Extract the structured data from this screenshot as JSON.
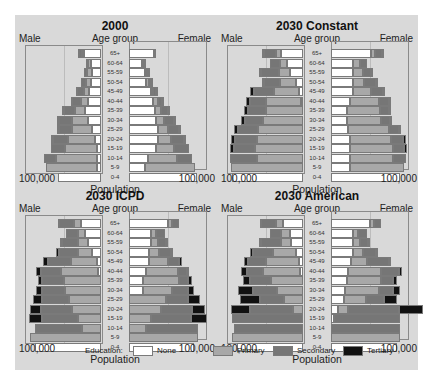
{
  "chart_data": [
    {
      "type": "bar",
      "subtype": "population-pyramid-stacked",
      "title": "2000",
      "xlabel": "Population",
      "ylabel": "Age group",
      "left_label": "Male",
      "right_label": "Female",
      "x_ticks": [
        "100,000",
        "100,000"
      ],
      "xlim": [
        0,
        100000
      ],
      "categories": [
        "65+",
        "60-64",
        "55-59",
        "50-54",
        "45-49",
        "40-44",
        "35-39",
        "30-34",
        "25-29",
        "20-24",
        "15-19",
        "10-14",
        "5-9",
        "0-4"
      ],
      "male": {
        "None": [
          24000,
          14000,
          13000,
          14000,
          16000,
          18000,
          22000,
          18000,
          12000,
          8000,
          6000,
          5000,
          6000,
          60000
        ],
        "Primary": [
          3000,
          4000,
          6000,
          7000,
          8000,
          10000,
          14000,
          22000,
          28000,
          38000,
          44000,
          58000,
          70000,
          0
        ],
        "Secondary": [
          4000,
          3000,
          5000,
          7000,
          9000,
          12000,
          16000,
          18000,
          18000,
          20000,
          20000,
          16000,
          0,
          0
        ],
        "Tertiary": [
          1000,
          0,
          0,
          0,
          2000,
          2000,
          2000,
          3000,
          3000,
          4000,
          0,
          0,
          0,
          0
        ]
      },
      "female": {
        "None": [
          35000,
          18000,
          22000,
          24000,
          30000,
          34000,
          36000,
          38000,
          40000,
          40000,
          38000,
          27000,
          22000,
          95000
        ],
        "Primary": [
          0,
          2000,
          2000,
          4000,
          4000,
          6000,
          8000,
          10000,
          14000,
          18000,
          24000,
          40000,
          70000,
          0
        ],
        "Secondary": [
          0,
          1000,
          2000,
          2000,
          4000,
          6000,
          10000,
          14000,
          16000,
          18000,
          22000,
          20000,
          0,
          0
        ],
        "Tertiary": [
          1000,
          1000,
          1000,
          1000,
          2000,
          2000,
          2000,
          2000,
          2000,
          2000,
          0,
          0,
          0,
          0
        ]
      }
    },
    {
      "type": "bar",
      "subtype": "population-pyramid-stacked",
      "title": "2030 Constant",
      "xlabel": "Population",
      "ylabel": "Age group",
      "left_label": "Male",
      "right_label": "Female",
      "x_ticks": [
        "100,000",
        "100,000"
      ],
      "xlim": [
        0,
        100000
      ],
      "categories": [
        "65+",
        "60-64",
        "55-59",
        "50-54",
        "45-49",
        "40-44",
        "35-39",
        "30-34",
        "25-29",
        "20-24",
        "15-19",
        "10-14",
        "5-9",
        "0-4"
      ],
      "male": {
        "None": [
          30000,
          22000,
          18000,
          10000,
          6000,
          3000,
          0,
          0,
          0,
          0,
          0,
          0,
          0,
          98000
        ],
        "Primary": [
          8000,
          10000,
          16000,
          22000,
          34000,
          48000,
          52000,
          56000,
          62000,
          64000,
          66000,
          64000,
          100000,
          0
        ],
        "Secondary": [
          16000,
          14000,
          24000,
          22000,
          28000,
          22000,
          24000,
          24000,
          28000,
          30000,
          30000,
          38000,
          0,
          0
        ],
        "Tertiary": [
          3000,
          0,
          3000,
          3000,
          6000,
          6000,
          6000,
          6000,
          6000,
          6000,
          6000,
          0,
          0,
          0
        ]
      },
      "female": {
        "None": [
          55000,
          30000,
          30000,
          30000,
          30000,
          26000,
          22000,
          22000,
          24000,
          26000,
          26000,
          26000,
          26000,
          96000
        ],
        "Primary": [
          6000,
          10000,
          14000,
          16000,
          26000,
          40000,
          46000,
          48000,
          56000,
          58000,
          60000,
          60000,
          75000,
          0
        ],
        "Secondary": [
          10000,
          10000,
          12000,
          16000,
          16000,
          14000,
          12000,
          12000,
          14000,
          16000,
          16000,
          18000,
          0,
          0
        ],
        "Tertiary": [
          2000,
          0,
          3000,
          3000,
          3000,
          3000,
          3000,
          3000,
          3000,
          4000,
          4000,
          0,
          0,
          0
        ]
      }
    },
    {
      "type": "bar",
      "subtype": "population-pyramid-stacked",
      "title": "2030 ICPD",
      "xlabel": "Population",
      "ylabel": "Age group",
      "left_label": "Male",
      "right_label": "Female",
      "x_ticks": [
        "100,000",
        "100,000"
      ],
      "xlim": [
        0,
        100000
      ],
      "categories": [
        "65+",
        "60-64",
        "55-59",
        "50-54",
        "45-49",
        "40-44",
        "35-39",
        "30-34",
        "25-29",
        "20-24",
        "15-19",
        "10-14",
        "5-9",
        "0-4"
      ],
      "male": {
        "None": [
          28000,
          22000,
          18000,
          12000,
          6000,
          4000,
          0,
          0,
          0,
          0,
          0,
          0,
          0,
          92000
        ],
        "Primary": [
          10000,
          10000,
          14000,
          20000,
          36000,
          52000,
          52000,
          50000,
          44000,
          40000,
          32000,
          26000,
          98000,
          0
        ],
        "Secondary": [
          20000,
          16000,
          22000,
          26000,
          32000,
          28000,
          30000,
          32000,
          38000,
          44000,
          50000,
          66000,
          0,
          0
        ],
        "Tertiary": [
          2000,
          0,
          3000,
          4000,
          6000,
          6000,
          6000,
          8000,
          12000,
          14000,
          18000,
          0,
          0,
          0
        ]
      },
      "female": {
        "None": [
          54000,
          30000,
          30000,
          28000,
          28000,
          24000,
          20000,
          20000,
          0,
          0,
          0,
          0,
          0,
          90000
        ],
        "Primary": [
          6000,
          8000,
          10000,
          14000,
          26000,
          44000,
          50000,
          40000,
          52000,
          44000,
          30000,
          24000,
          96000,
          0
        ],
        "Secondary": [
          10000,
          12000,
          12000,
          16000,
          16000,
          12000,
          12000,
          22000,
          30000,
          44000,
          56000,
          72000,
          0,
          0
        ],
        "Tertiary": [
          0,
          0,
          2000,
          2000,
          4000,
          4000,
          6000,
          8000,
          16000,
          18000,
          22000,
          0,
          0,
          0
        ]
      }
    },
    {
      "type": "bar",
      "subtype": "population-pyramid-stacked",
      "title": "2030 American",
      "xlabel": "Population",
      "ylabel": "Age group",
      "left_label": "Male",
      "right_label": "Female",
      "x_ticks": [
        "100,000",
        "100,000"
      ],
      "xlim": [
        0,
        100000
      ],
      "categories": [
        "65+",
        "60-64",
        "55-59",
        "50-54",
        "45-49",
        "40-44",
        "35-39",
        "30-34",
        "25-29",
        "20-24",
        "15-19",
        "10-14",
        "5-9",
        "0-4"
      ],
      "male": {
        "None": [
          28000,
          18000,
          16000,
          10000,
          6000,
          4000,
          0,
          0,
          0,
          0,
          0,
          0,
          0,
          92000
        ],
        "Primary": [
          10000,
          12000,
          14000,
          32000,
          46000,
          52000,
          44000,
          36000,
          26000,
          14000,
          0,
          0,
          98000,
          0
        ],
        "Secondary": [
          20000,
          16000,
          28000,
          28000,
          24000,
          22000,
          30000,
          34000,
          34000,
          60000,
          98000,
          96000,
          0,
          0
        ],
        "Tertiary": [
          2000,
          0,
          3000,
          4000,
          6000,
          8000,
          10000,
          20000,
          28000,
          26000,
          0,
          0,
          0,
          0
        ]
      },
      "female": {
        "None": [
          54000,
          30000,
          30000,
          30000,
          28000,
          24000,
          22000,
          20000,
          18000,
          10000,
          4000,
          0,
          0,
          92000
        ],
        "Primary": [
          6000,
          8000,
          10000,
          14000,
          22000,
          46000,
          48000,
          46000,
          30000,
          14000,
          0,
          0,
          96000,
          0
        ],
        "Secondary": [
          10000,
          12000,
          12000,
          18000,
          30000,
          24000,
          16000,
          20000,
          26000,
          70000,
          92000,
          96000,
          0,
          0
        ],
        "Tertiary": [
          0,
          0,
          2000,
          2000,
          4000,
          4000,
          6000,
          10000,
          18000,
          34000,
          0,
          0,
          0,
          0
        ]
      }
    }
  ],
  "panels": [
    {
      "title": "2000"
    },
    {
      "title": "2030 Constant"
    },
    {
      "title": "2030 ICPD"
    },
    {
      "title": "2030 American"
    }
  ],
  "labels": {
    "male": "Male",
    "female": "Female",
    "age_group": "Age group",
    "population": "Population",
    "tick": "100,000"
  },
  "legend": {
    "title": "Education:",
    "items": [
      {
        "label": "None",
        "color": "#ffffff"
      },
      {
        "label": "Primary",
        "color": "#a8a8a8"
      },
      {
        "label": "Secondary",
        "color": "#767676"
      },
      {
        "label": "Tertiary",
        "color": "#111111"
      }
    ]
  }
}
